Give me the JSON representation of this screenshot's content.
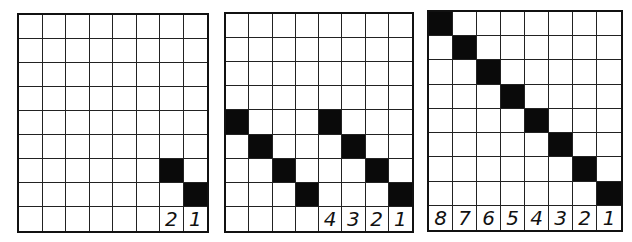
{
  "diagram": {
    "colors": {
      "filled": "#0a0a0a",
      "empty": "#ffffff",
      "line": "#222222"
    },
    "panels": [
      {
        "id": "panel-1",
        "cols": 8,
        "rows": 8,
        "filled": [
          [
            6,
            6
          ],
          [
            7,
            7
          ]
        ],
        "labels": [
          "",
          "",
          "",
          "",
          "",
          "",
          "2",
          "1"
        ]
      },
      {
        "id": "panel-2",
        "cols": 8,
        "rows": 8,
        "filled": [
          [
            4,
            0
          ],
          [
            5,
            1
          ],
          [
            6,
            2
          ],
          [
            7,
            3
          ],
          [
            4,
            4
          ],
          [
            5,
            5
          ],
          [
            6,
            6
          ],
          [
            7,
            7
          ]
        ],
        "labels": [
          "",
          "",
          "",
          "",
          "4",
          "3",
          "2",
          "1"
        ]
      },
      {
        "id": "panel-3",
        "cols": 8,
        "rows": 8,
        "filled": [
          [
            0,
            0
          ],
          [
            1,
            1
          ],
          [
            2,
            2
          ],
          [
            3,
            3
          ],
          [
            4,
            4
          ],
          [
            5,
            5
          ],
          [
            6,
            6
          ],
          [
            7,
            7
          ]
        ],
        "labels": [
          "8",
          "7",
          "6",
          "5",
          "4",
          "3",
          "2",
          "1"
        ]
      }
    ]
  }
}
